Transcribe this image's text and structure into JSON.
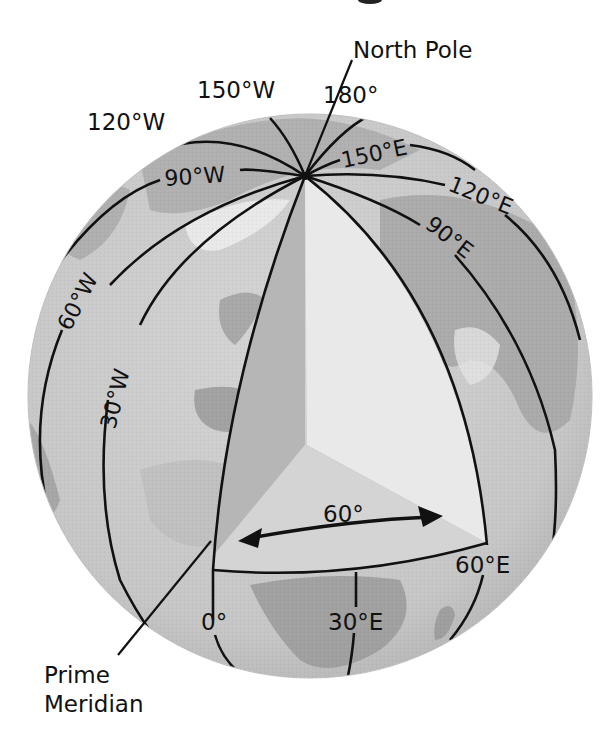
{
  "figure": {
    "title_fragment": "g",
    "colors": {
      "background": "#ffffff",
      "globe_ocean": "#c9c9c9",
      "land_dark": "#9a9a9a",
      "land_light": "#e4e4e4",
      "wedge_left_face": "#b5b5b5",
      "wedge_right_face": "#e9e9e9",
      "wedge_bottom_face": "#d3d3d3",
      "line": "#111111"
    },
    "callouts": {
      "north_pole": "North Pole",
      "prime_meridian_line1": "Prime",
      "prime_meridian_line2": "Meridian"
    },
    "meridian_labels": {
      "w150": "150°W",
      "w120": "120°W",
      "w90": "90°W",
      "w60": "60°W",
      "w30": "30°W",
      "e180": "180°",
      "e150": "150°E",
      "e120": "120°E",
      "e90": "90°E",
      "e60": "60°E",
      "e30": "30°E",
      "zero": "0°"
    },
    "angle_label": "60°"
  }
}
